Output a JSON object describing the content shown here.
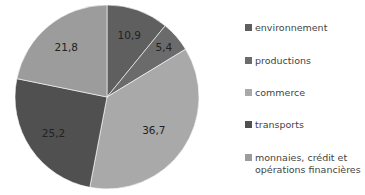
{
  "chart_data": {
    "type": "pie",
    "title": "",
    "categories": [
      "environnement",
      "productions",
      "commerce",
      "transports",
      "monnaies, crédit et opérations financières"
    ],
    "values": [
      10.9,
      5.4,
      36.7,
      25.2,
      21.8
    ],
    "value_labels": [
      "10,9",
      "5,4",
      "36,7",
      "25,2",
      "21,8"
    ],
    "colors": [
      "#5f5f5f",
      "#6b6b6b",
      "#a9a9a9",
      "#505050",
      "#9c9c9c"
    ],
    "start_angle_deg": 0,
    "direction": "clockwise",
    "legend_position": "right"
  },
  "legend": {
    "items": [
      {
        "label": "environnement",
        "color": "#5f5f5f"
      },
      {
        "label": "productions",
        "color": "#6b6b6b"
      },
      {
        "label": "commerce",
        "color": "#a9a9a9"
      },
      {
        "label": "transports",
        "color": "#505050"
      },
      {
        "label": "monnaies, crédit et opérations financières",
        "color": "#9c9c9c"
      }
    ]
  }
}
